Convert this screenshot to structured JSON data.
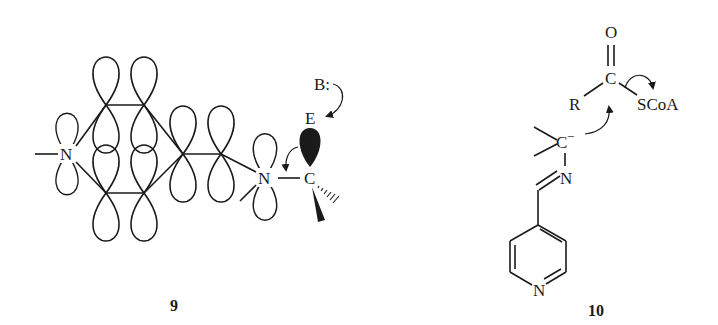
{
  "figure": {
    "structures": [
      {
        "id": "9",
        "label": "9",
        "atoms": {
          "n_left": "N",
          "n_right": "N",
          "carbon": "C",
          "electrophile": "E",
          "base": "B:"
        },
        "description": "p-orbital overlap diagram of conjugated system bearing N-C bond with filled lobe toward electrophile E attacked by base B:"
      },
      {
        "id": "10",
        "label": "10",
        "atoms": {
          "oxygen": "O",
          "carbonyl_carbon": "C",
          "r_group": "R",
          "thioester": "SCoA",
          "carbanion": "C",
          "carbanion_charge": "−",
          "imine_n": "N",
          "pyridine_n": "N"
        },
        "description": "Carbanion adjacent to imine of pyridine-4-carboxaldehyde attacks acyl-CoA thioester carbonyl"
      }
    ],
    "colors": {
      "ink": "#1a1a1a",
      "background": "#ffffff"
    }
  }
}
